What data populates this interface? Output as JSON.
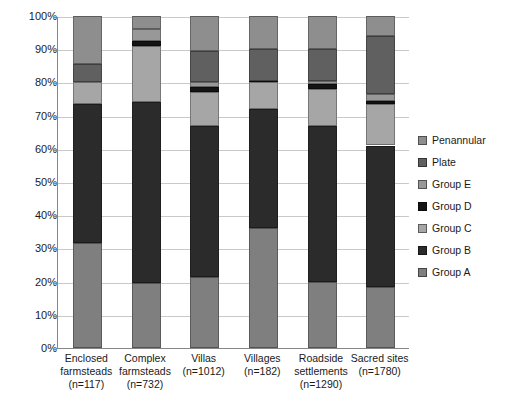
{
  "chart_data": {
    "type": "bar",
    "subtype": "stacked-percentage",
    "title": "",
    "xlabel": "",
    "ylabel": "",
    "ylim": [
      0,
      100
    ],
    "yticks": [
      "0%",
      "10%",
      "20%",
      "30%",
      "40%",
      "50%",
      "60%",
      "70%",
      "80%",
      "90%",
      "100%"
    ],
    "ytick_values": [
      0,
      10,
      20,
      30,
      40,
      50,
      60,
      70,
      80,
      90,
      100
    ],
    "grid": true,
    "legend_position": "right",
    "categories": [
      "Enclosed farmsteads (n=117)",
      "Complex farmsteads (n=732)",
      "Villas (n=1012)",
      "Villages (n=182)",
      "Roadside settlements (n=1290)",
      "Sacred sites (n=1780)"
    ],
    "category_lines": [
      [
        "Enclosed",
        "farmsteads",
        "(n=117)"
      ],
      [
        "Complex",
        "farmsteads",
        "(n=732)"
      ],
      [
        "Villas",
        "(n=1012)"
      ],
      [
        "Villages",
        "(n=182)"
      ],
      [
        "Roadside",
        "settlements",
        "(n=1290)"
      ],
      [
        "Sacred sites",
        "(n=1780)"
      ]
    ],
    "series": [
      {
        "name": "Group A",
        "color": "#7f7f7f",
        "values": [
          31.5,
          19.5,
          21.5,
          36.0,
          20.0,
          18.5
        ]
      },
      {
        "name": "Group B",
        "color": "#2b2b2b",
        "values": [
          42.0,
          54.5,
          45.5,
          36.0,
          47.0,
          42.5
        ]
      },
      {
        "name": "Group C",
        "color": "#a6a6a6",
        "values": [
          6.5,
          17.0,
          10.0,
          8.0,
          11.0,
          12.5
        ]
      },
      {
        "name": "Group D",
        "color": "#141414",
        "values": [
          0.0,
          1.5,
          1.5,
          0.5,
          1.5,
          1.0
        ]
      },
      {
        "name": "Group E",
        "color": "#989898",
        "values": [
          0.0,
          3.5,
          1.5,
          0.0,
          1.0,
          2.0
        ]
      },
      {
        "name": "Plate",
        "color": "#606060",
        "values": [
          5.5,
          0.0,
          9.5,
          9.5,
          9.5,
          17.5
        ]
      },
      {
        "name": "Penannular",
        "color": "#8e8e8e",
        "values": [
          14.5,
          4.0,
          10.5,
          10.0,
          10.0,
          6.0
        ]
      }
    ]
  },
  "legend": {
    "items": [
      {
        "label": "Penannular",
        "color": "#8e8e8e"
      },
      {
        "label": "Plate",
        "color": "#606060"
      },
      {
        "label": "Group E",
        "color": "#989898"
      },
      {
        "label": "Group D",
        "color": "#141414"
      },
      {
        "label": "Group C",
        "color": "#a6a6a6"
      },
      {
        "label": "Group B",
        "color": "#2b2b2b"
      },
      {
        "label": "Group A",
        "color": "#7f7f7f"
      }
    ]
  },
  "axes": {
    "grid_color": "#c9c9c9",
    "axis_color": "#868686"
  }
}
